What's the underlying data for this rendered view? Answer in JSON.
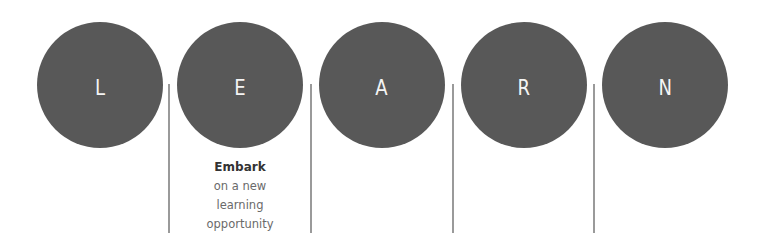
{
  "title": "LEARN",
  "colors": {
    "circle_fill": "#585858",
    "letter": "#f4f4f4",
    "divider": "#9a9a9a",
    "caption_head": "#333333",
    "caption_body": "#6a6a6a"
  },
  "steps": [
    {
      "letter": "L"
    },
    {
      "letter": "E",
      "caption": {
        "head": "Embark",
        "lines": [
          "on a new",
          "learning",
          "opportunity"
        ]
      }
    },
    {
      "letter": "A"
    },
    {
      "letter": "R"
    },
    {
      "letter": "N"
    }
  ]
}
